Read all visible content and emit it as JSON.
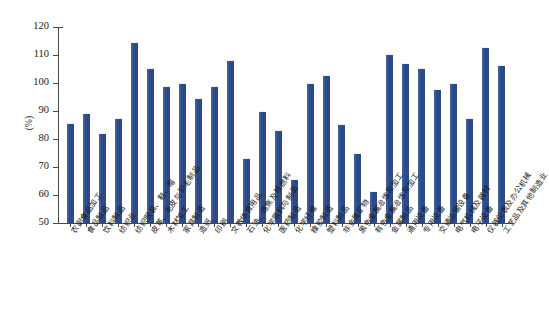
{
  "chart_data": {
    "type": "bar",
    "title": "",
    "xlabel": "",
    "ylabel": "(%)",
    "ylim": [
      50,
      120
    ],
    "yticks": [
      50,
      60,
      70,
      80,
      90,
      100,
      110,
      120
    ],
    "grid": false,
    "legend": null,
    "bar_color": "#2b4a8b",
    "categories": [
      "农副食品加工",
      "食品制品",
      "饮料制品",
      "纺织业",
      "纺织服装、鞋、帽",
      "皮革、毛皮与羽毛制品",
      "木材加工",
      "家具制造",
      "造纸",
      "印刷",
      "文教体育用品",
      "石油、炼焦及核燃料",
      "化学原料与制品",
      "医药制造",
      "化学纤维",
      "橡胶制造",
      "塑料制品",
      "非金属矿物",
      "黑色金属冶炼及加工",
      "有色金属冶炼及加工",
      "金属制品",
      "通用设备",
      "专用设备",
      "交通运输设备",
      "电气机械及器材",
      "电子设备",
      "仪器仪表及办公机械",
      "工艺品及其他制造业"
    ],
    "values": [
      85.8,
      89.3,
      82.2,
      87.6,
      114.5,
      105.3,
      98.9,
      100.1,
      94.5,
      98.9,
      108.1,
      73.2,
      90.0,
      83.1,
      65.6,
      100.0,
      102.8,
      85.5,
      75.0,
      61.3,
      110.3,
      107.0,
      105.5,
      97.9,
      100.1,
      87.5,
      113.0,
      106.3
    ]
  },
  "axis": {
    "y_title": "(%)",
    "y_tick_labels": [
      "120",
      "110",
      "100",
      "90",
      "80",
      "70",
      "60",
      "50"
    ]
  }
}
